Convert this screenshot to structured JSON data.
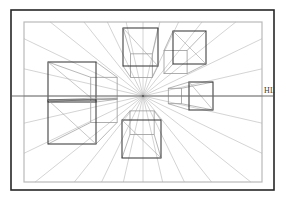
{
  "figure": {
    "labels": {
      "horizon_line": "HL"
    },
    "colors": {
      "background": "#ffffff",
      "outer_frame": "#262626",
      "inner_frame": "#b9b9b9",
      "box_stroke": "#3a3a3a",
      "box_stroke_light": "#9a9a9a",
      "convergence_ray": "#b0b0b0",
      "horizon_line": "#6f6f6f",
      "label_text": "#3a3a3a"
    },
    "frames": {
      "outer": {
        "x": 11,
        "y": 10,
        "width": 263,
        "height": 180,
        "stroke_width": 1.6
      },
      "inner": {
        "x": 24,
        "y": 22,
        "width": 238,
        "height": 160,
        "stroke_width": 1.2
      }
    },
    "vanishing_point": {
      "x": 143,
      "y": 96,
      "label": "VP"
    },
    "horizon": {
      "y": 96,
      "x_start": 12,
      "x_end": 273,
      "stroke_width": 1.1
    },
    "label_positions": {
      "hl": {
        "x": 264,
        "y": 93
      }
    },
    "boxes": [
      {
        "name": "top-center-box",
        "position": "above-horizon-center",
        "front": {
          "x": 123,
          "y": 28,
          "width": 35,
          "height": 38
        },
        "back_scale": 0.62,
        "visible_faces": [
          "front",
          "bottom",
          "left"
        ]
      },
      {
        "name": "top-right-box",
        "position": "above-horizon-right",
        "front": {
          "x": 173,
          "y": 31,
          "width": 33,
          "height": 33
        },
        "back_scale": 0.7,
        "visible_faces": [
          "front",
          "bottom",
          "left"
        ]
      },
      {
        "name": "right-box",
        "position": "on-horizon-right",
        "front": {
          "x": 189,
          "y": 82,
          "width": 24,
          "height": 28
        },
        "back_scale": 0.55,
        "visible_faces": [
          "front",
          "left"
        ]
      },
      {
        "name": "left-upper-box",
        "position": "above-horizon-left",
        "front": {
          "x": 48,
          "y": 62,
          "width": 48,
          "height": 40
        },
        "back_scale": 0.55,
        "visible_faces": [
          "front",
          "bottom",
          "right"
        ]
      },
      {
        "name": "left-lower-box",
        "position": "below-horizon-left",
        "front": {
          "x": 48,
          "y": 100,
          "width": 48,
          "height": 44
        },
        "back_scale": 0.55,
        "visible_faces": [
          "front",
          "top",
          "right"
        ]
      },
      {
        "name": "bottom-center-box",
        "position": "below-horizon-center",
        "front": {
          "x": 122,
          "y": 120,
          "width": 39,
          "height": 38
        },
        "back_scale": 0.62,
        "visible_faces": [
          "front",
          "top",
          "right"
        ]
      }
    ],
    "ray_count": 28
  }
}
